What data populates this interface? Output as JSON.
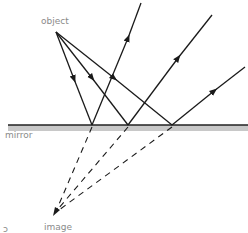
{
  "diagram": {
    "labels": {
      "object": "object",
      "mirror": "mirror",
      "image": "image",
      "corner_mark": "ɔ"
    },
    "colors": {
      "ray": "#1a1a1a",
      "mirror_line": "#222222",
      "mirror_band": "#c8c8c8",
      "label": "#8a8a8a"
    },
    "points": {
      "object": [
        56,
        32
      ],
      "image": [
        55,
        213
      ],
      "reflection_points": [
        [
          92,
          125
        ],
        [
          128,
          125
        ],
        [
          172,
          125
        ]
      ]
    },
    "reflected_ray_ends": [
      [
        141,
        3
      ],
      [
        212,
        15
      ],
      [
        245,
        67
      ]
    ]
  }
}
